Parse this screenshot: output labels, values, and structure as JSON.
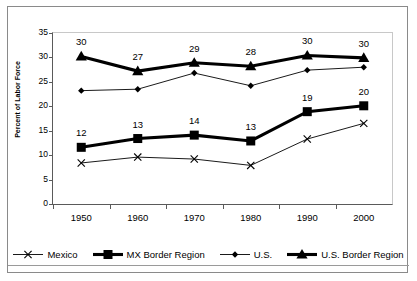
{
  "chart_data": {
    "type": "line",
    "title": "",
    "xlabel": "",
    "ylabel": "Percent of Labor Force",
    "categories": [
      "1950",
      "1960",
      "1970",
      "1980",
      "1990",
      "2000"
    ],
    "ylim": [
      0,
      35
    ],
    "ytick_labels": [
      "0",
      "5",
      "10",
      "15",
      "20",
      "25",
      "30",
      "35"
    ],
    "ytick_values": [
      0,
      5,
      10,
      15,
      20,
      25,
      30,
      35
    ],
    "grid": false,
    "legend_position": "bottom",
    "series": [
      {
        "name": "Mexico",
        "marker": "x",
        "line_weight": "thin",
        "values": [
          8.4,
          9.6,
          9.2,
          7.9,
          13.3,
          16.5
        ],
        "labels": []
      },
      {
        "name": "MX Border Region",
        "marker": "square",
        "line_weight": "thick",
        "values": [
          11.6,
          13.4,
          14.1,
          12.9,
          18.9,
          20.1
        ],
        "labels": [
          "12",
          "13",
          "14",
          "13",
          "19",
          "20"
        ]
      },
      {
        "name": "U.S.",
        "marker": "diamond",
        "line_weight": "thin",
        "values": [
          23.2,
          23.5,
          26.8,
          24.2,
          27.4,
          28.0
        ],
        "labels": []
      },
      {
        "name": "U.S. Border Region",
        "marker": "triangle",
        "line_weight": "thick",
        "values": [
          30.2,
          27.2,
          28.9,
          28.2,
          30.4,
          29.9
        ],
        "labels": [
          "30",
          "27",
          "29",
          "28",
          "30",
          "30"
        ]
      }
    ],
    "colors": {
      "series_line": "#000000",
      "marker_fill": "#000000",
      "axis": "#5a5a5a",
      "frame": "#8a8a8a",
      "background": "#ffffff"
    }
  }
}
